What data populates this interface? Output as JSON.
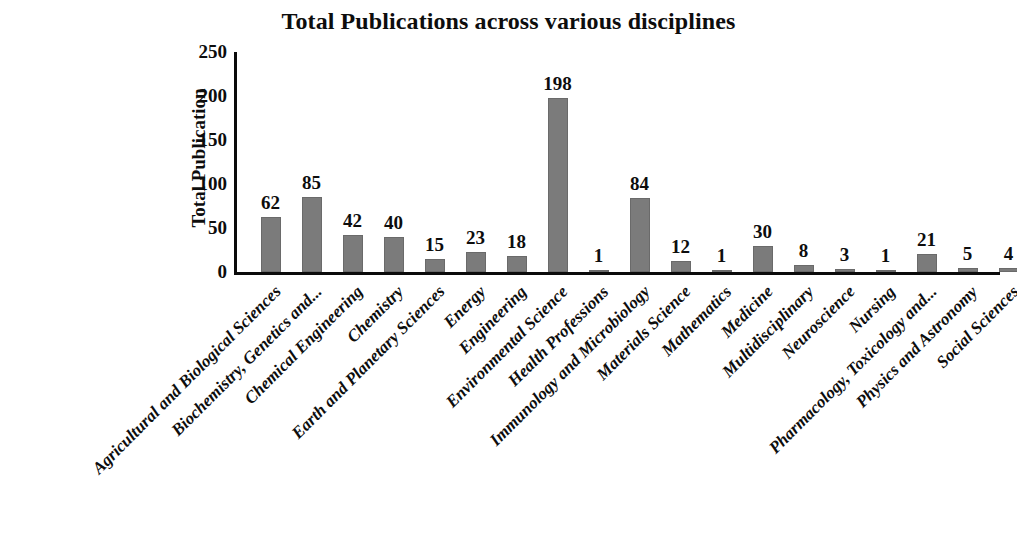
{
  "chart_data": {
    "type": "bar",
    "title": "Total Publications across various disciplines",
    "xlabel": "",
    "ylabel": "Total Publication",
    "ylim": [
      0,
      250
    ],
    "yticks": [
      0,
      50,
      100,
      150,
      200,
      250
    ],
    "grid": false,
    "legend": null,
    "bar_color": "#7b7b7b",
    "value_labels": true,
    "categories": [
      "Agricultural and Biological Sciences",
      "Biochemistry, Genetics and...",
      "Chemical Engineering",
      "Chemistry",
      "Earth and Planetary Sciences",
      "Energy",
      "Engineering",
      "Environmental Science",
      "Health Professions",
      "Immunology and Microbiology",
      "Materials Science",
      "Mathematics",
      "Medicine",
      "Multidisciplinary",
      "Neuroscience",
      "Nursing",
      "Pharmacology, Toxicology and...",
      "Physics and Astronomy",
      "Social Sciences"
    ],
    "values": [
      62,
      85,
      42,
      40,
      15,
      23,
      18,
      198,
      1,
      84,
      12,
      1,
      30,
      8,
      3,
      1,
      21,
      5,
      4
    ]
  }
}
